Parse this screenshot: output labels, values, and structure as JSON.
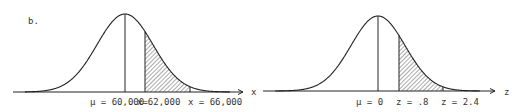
{
  "part_label": "b.",
  "chart_data": [
    {
      "type": "area",
      "title": "",
      "axis_label": "x",
      "distribution": "normal",
      "mean": 60000,
      "shaded_region": [
        62000,
        66000
      ],
      "annotations": [
        "μ = 60,000",
        "x=62,000",
        "x = 66,000"
      ]
    },
    {
      "type": "area",
      "title": "",
      "axis_label": "z",
      "distribution": "standard normal",
      "mean": 0,
      "shaded_region": [
        0.8,
        2.4
      ],
      "annotations": [
        "μ = 0",
        "z = .8",
        "z = 2.4"
      ]
    }
  ],
  "left": {
    "mu": "μ = 60,000",
    "x1": "x=62,000",
    "x2": "x = 66,000",
    "axis": "x"
  },
  "right": {
    "mu": "μ = 0",
    "z1": "z = .8",
    "z2": "z = 2.4",
    "axis": "z"
  }
}
